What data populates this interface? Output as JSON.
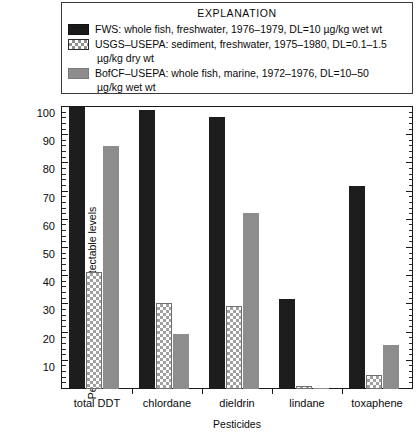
{
  "legend": {
    "title": "EXPLANATION",
    "entries": [
      {
        "swatch": "solid-black-swatch",
        "text": "FWS: whole fish, freshwater, 1976–1979, DL=10 µg/kg wet wt",
        "continuation": ""
      },
      {
        "swatch": "checkered-swatch",
        "text": "USGS–USEPA: sediment, freshwater, 1975–1980, DL=0.1–1.5",
        "continuation": "µg/kg dry wt"
      },
      {
        "swatch": "solid-gray-swatch",
        "text": "BofCF–USEPA: whole fish, marine, 1972–1976, DL=10–50",
        "continuation": "µg/kg wet wt"
      }
    ]
  },
  "axes": {
    "ylabel": "Percentage of sites with detectable levels",
    "xlabel": "Pesticides",
    "yticks": [
      0,
      10,
      20,
      30,
      40,
      50,
      60,
      70,
      80,
      90,
      100
    ]
  },
  "colors": {
    "fws": "#1d1d1d",
    "usgs_fill": "#ffffff",
    "usgs_hatch": "#a0a0a0",
    "bofcf": "#8d8d8d",
    "axis": "#1a1a1a",
    "background": "#ffffff"
  },
  "chart_data": {
    "type": "bar",
    "title": "",
    "subtitle": "",
    "xlabel": "Pesticides",
    "ylabel": "Percentage of sites with detectable levels",
    "ylim": [
      0,
      100
    ],
    "grid": false,
    "legend_position": "top",
    "legend_title": "EXPLANATION",
    "categories": [
      "total DDT",
      "chlordane",
      "dieldrin",
      "lindane",
      "toxaphene"
    ],
    "series": [
      {
        "name": "FWS: whole fish, freshwater, 1976–1979, DL=10 µg/kg wet wt",
        "short_name": "FWS",
        "values": [
          100,
          99,
          96.5,
          32,
          72
        ]
      },
      {
        "name": "USGS–USEPA: sediment, freshwater, 1975–1980, DL=0.1–1.5 µg/kg dry wt",
        "short_name": "USGS–USEPA",
        "values": [
          41.5,
          30.5,
          29.5,
          1,
          5
        ]
      },
      {
        "name": "BofCF–USEPA: whole fish, marine, 1972–1976, DL=10–50 µg/kg wet wt",
        "short_name": "BofCF–USEPA",
        "values": [
          86,
          19.5,
          62.5,
          0.5,
          15.5
        ]
      }
    ],
    "ytick_minor_step": 2,
    "ytick_major_step": 10
  }
}
